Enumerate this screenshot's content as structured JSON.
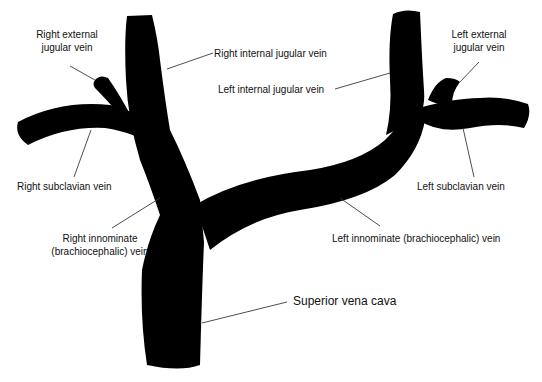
{
  "diagram": {
    "vein_color": "#000000",
    "background": "#ffffff",
    "labels": [
      {
        "id": "right_external_jugular",
        "line1": "Right external",
        "line2": "jugular vein"
      },
      {
        "id": "right_internal_jugular",
        "line1": "Right internal jugular vein"
      },
      {
        "id": "left_internal_jugular",
        "line1": "Left internal jugular vein"
      },
      {
        "id": "left_external_jugular",
        "line1": "Left external",
        "line2": "jugular vein"
      },
      {
        "id": "right_subclavian",
        "line1": "Right subclavian vein"
      },
      {
        "id": "left_subclavian",
        "line1": "Left subclavian vein"
      },
      {
        "id": "right_innominate",
        "line1": "Right innominate",
        "line2": "(brachiocephalic) vein"
      },
      {
        "id": "left_innominate",
        "line1": "Left innominate (brachiocephalic) vein"
      },
      {
        "id": "superior_vena_cava",
        "line1": "Superior vena cava"
      }
    ]
  }
}
